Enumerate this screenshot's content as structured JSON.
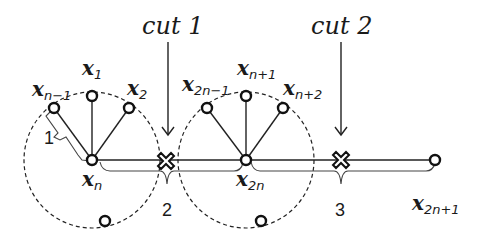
{
  "diagram": {
    "cuts": [
      {
        "label": "cut 1"
      },
      {
        "label": "cut 2"
      }
    ],
    "segments": [
      {
        "label": "1"
      },
      {
        "label": "2"
      },
      {
        "label": "3"
      }
    ],
    "nodes": {
      "x_n_minus_1": {
        "base": "x",
        "sub": "n−1"
      },
      "x_1": {
        "base": "x",
        "sub": "1"
      },
      "x_2": {
        "base": "x",
        "sub": "2"
      },
      "x_n": {
        "base": "x",
        "sub": "n"
      },
      "x_2n_minus_1": {
        "base": "x",
        "sub": "2n−1"
      },
      "x_n_plus_1": {
        "base": "x",
        "sub": "n+1"
      },
      "x_n_plus_2": {
        "base": "x",
        "sub": "n+2"
      },
      "x_2n": {
        "base": "x",
        "sub": "2n"
      },
      "x_2n_plus_1": {
        "base": "x",
        "sub": "2n+1"
      }
    },
    "colors": {
      "stroke": "#222222",
      "background": "#ffffff"
    }
  }
}
